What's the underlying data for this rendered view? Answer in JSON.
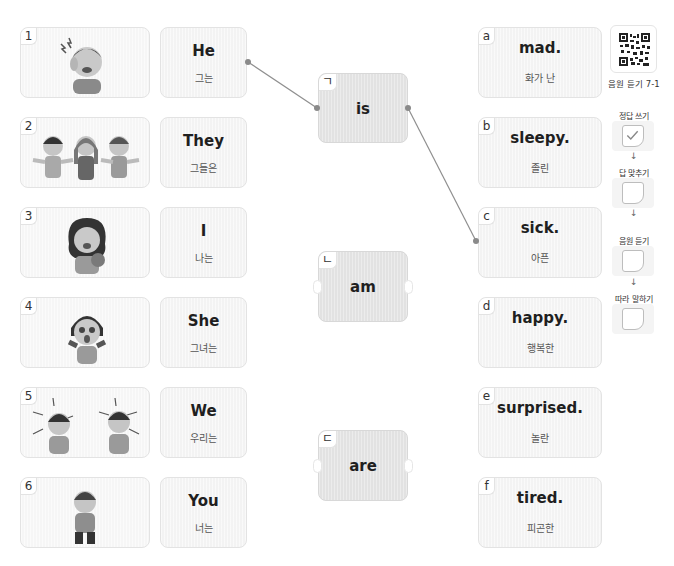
{
  "exercise": {
    "pictures": [
      {
        "number": "1",
        "scene": "boy with headache / sick"
      },
      {
        "number": "2",
        "scene": "three children laughing happily"
      },
      {
        "number": "3",
        "scene": "girl yawning with teddy bear / sleepy"
      },
      {
        "number": "4",
        "scene": "girl surprised with open mouth"
      },
      {
        "number": "5",
        "scene": "two boys shouting angrily / mad"
      },
      {
        "number": "6",
        "scene": "boy bending over exhausted / tired"
      }
    ],
    "subjects": [
      {
        "en": "He",
        "ko": "그는"
      },
      {
        "en": "They",
        "ko": "그들은"
      },
      {
        "en": "I",
        "ko": "나는"
      },
      {
        "en": "She",
        "ko": "그녀는"
      },
      {
        "en": "We",
        "ko": "우리는"
      },
      {
        "en": "You",
        "ko": "너는"
      }
    ],
    "verbs": [
      {
        "tag": "ㄱ",
        "word": "is"
      },
      {
        "tag": "ㄴ",
        "word": "am"
      },
      {
        "tag": "ㄷ",
        "word": "are"
      }
    ],
    "adjectives": [
      {
        "tag": "a",
        "en": "mad.",
        "ko": "화가 난"
      },
      {
        "tag": "b",
        "en": "sleepy.",
        "ko": "졸린"
      },
      {
        "tag": "c",
        "en": "sick.",
        "ko": "아픈"
      },
      {
        "tag": "d",
        "en": "happy.",
        "ko": "행복한"
      },
      {
        "tag": "e",
        "en": "surprised.",
        "ko": "놀란"
      },
      {
        "tag": "f",
        "en": "tired.",
        "ko": "피곤한"
      }
    ],
    "connections": [
      {
        "from": "He",
        "to": "is"
      },
      {
        "from": "is",
        "to": "sick."
      }
    ]
  },
  "side_panel": {
    "audio_label": "음원 듣기 7-1",
    "steps": [
      {
        "label": "정답 쓰기",
        "checked": true
      },
      {
        "label": "답 맞추기",
        "checked": false
      },
      {
        "label": "음원 듣기",
        "checked": false
      },
      {
        "label": "따라 말하기",
        "checked": false
      }
    ],
    "arrow_glyph": "↓"
  },
  "colors": {
    "card_bg": "#f3f3f3",
    "verb_card_bg": "#e2e2e2",
    "line": "#8a8a8a"
  }
}
